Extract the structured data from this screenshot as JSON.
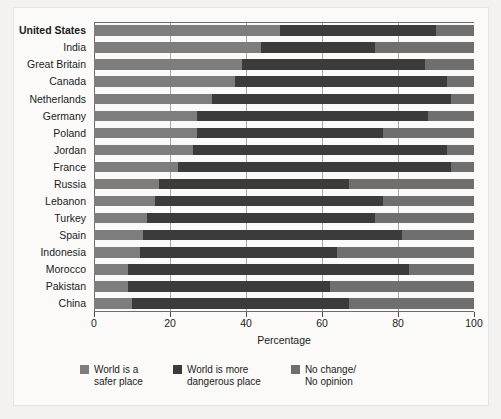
{
  "chart_data": {
    "type": "bar",
    "orientation": "horizontal",
    "stacked": true,
    "title": "",
    "xlabel": "Percentage",
    "ylabel": "",
    "xlim": [
      0,
      100
    ],
    "xticks": [
      0,
      20,
      40,
      60,
      80,
      100
    ],
    "xticklabels": [
      "0",
      "20",
      "40",
      "60",
      "80",
      "100"
    ],
    "grid": "vertical",
    "legend_position": "bottom",
    "categories": [
      "United States",
      "India",
      "Great Britain",
      "Canada",
      "Netherlands",
      "Germany",
      "Poland",
      "Jordan",
      "France",
      "Russia",
      "Lebanon",
      "Turkey",
      "Spain",
      "Indonesia",
      "Morocco",
      "Pakistan",
      "China"
    ],
    "highlighted_category": "United States",
    "series": [
      {
        "name": "World is a safer place",
        "color": "#7d7d7d",
        "values": [
          49,
          44,
          39,
          37,
          31,
          27,
          27,
          26,
          22,
          17,
          16,
          14,
          13,
          12,
          9,
          9,
          10
        ]
      },
      {
        "name": "World is more dangerous place",
        "color": "#3b3b3b",
        "values": [
          41,
          30,
          48,
          56,
          63,
          61,
          49,
          67,
          72,
          50,
          60,
          60,
          68,
          52,
          74,
          53,
          57
        ]
      },
      {
        "name": "No change/No opinion",
        "color": "#6f6f6f",
        "values": [
          10,
          26,
          13,
          7,
          6,
          12,
          24,
          7,
          6,
          33,
          24,
          26,
          19,
          36,
          17,
          38,
          33
        ]
      }
    ]
  },
  "legend": {
    "items": [
      {
        "label": "World is a\nsafer place",
        "color": "#7d7d7d",
        "key": "safer"
      },
      {
        "label": "World is more\ndangerous place",
        "color": "#3b3b3b",
        "key": "dangerous"
      },
      {
        "label": "No change/\nNo opinion",
        "color": "#6f6f6f",
        "key": "nochange"
      }
    ]
  },
  "axis": {
    "x_title": "Percentage"
  }
}
